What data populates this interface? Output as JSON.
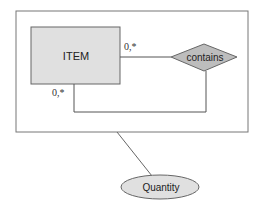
{
  "diagram": {
    "type": "er-diagram",
    "entity": {
      "label": "ITEM",
      "fill": "#e0e0e0"
    },
    "relationship": {
      "label": "contains",
      "fill": "#bdbdbd"
    },
    "attribute": {
      "label": "Quantity",
      "fill": "#e0e0e0"
    },
    "cardinalities": [
      {
        "label": "0,*",
        "position": "item-right"
      },
      {
        "label": "0,*",
        "position": "item-bottom"
      }
    ],
    "line_color": "#555555",
    "frame_color": "#777777"
  }
}
